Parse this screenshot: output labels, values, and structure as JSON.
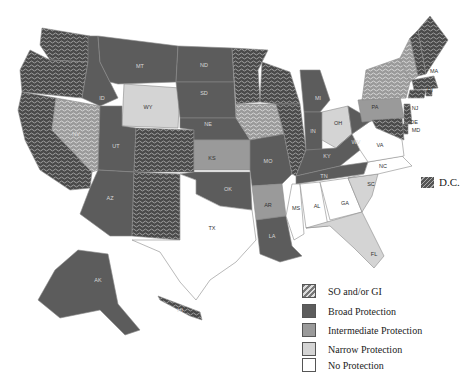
{
  "colors": {
    "so_gi": "#5a5a5a",
    "broad": "#5c5c5c",
    "intermediate": "#9a9a9a",
    "narrow": "#d4d4d4",
    "none": "#ffffff"
  },
  "legend": [
    {
      "key": "so_gi",
      "label": "SO and/or  GI"
    },
    {
      "key": "broad",
      "label": "Broad Protection"
    },
    {
      "key": "intermediate",
      "label": "Intermediate Protection"
    },
    {
      "key": "narrow",
      "label": "Narrow Protection"
    },
    {
      "key": "none",
      "label": "No Protection"
    }
  ],
  "dc": {
    "label": "D.C.",
    "category": "so_gi"
  },
  "states": [
    {
      "abbr": "WA",
      "category": "so_gi"
    },
    {
      "abbr": "OR",
      "category": "so_gi"
    },
    {
      "abbr": "CA",
      "category": "so_gi"
    },
    {
      "abbr": "NV",
      "category": "so_gi"
    },
    {
      "abbr": "ID",
      "category": "broad"
    },
    {
      "abbr": "MT",
      "category": "broad"
    },
    {
      "abbr": "WY",
      "category": "narrow"
    },
    {
      "abbr": "UT",
      "category": "broad"
    },
    {
      "abbr": "AZ",
      "category": "broad"
    },
    {
      "abbr": "CO",
      "category": "so_gi"
    },
    {
      "abbr": "NM",
      "category": "so_gi"
    },
    {
      "abbr": "ND",
      "category": "broad"
    },
    {
      "abbr": "SD",
      "category": "broad"
    },
    {
      "abbr": "NE",
      "category": "broad"
    },
    {
      "abbr": "KS",
      "category": "intermediate"
    },
    {
      "abbr": "OK",
      "category": "broad"
    },
    {
      "abbr": "TX",
      "category": "none"
    },
    {
      "abbr": "MN",
      "category": "so_gi"
    },
    {
      "abbr": "IA",
      "category": "so_gi"
    },
    {
      "abbr": "MO",
      "category": "broad"
    },
    {
      "abbr": "AR",
      "category": "intermediate"
    },
    {
      "abbr": "LA",
      "category": "broad"
    },
    {
      "abbr": "WI",
      "category": "so_gi"
    },
    {
      "abbr": "IL",
      "category": "so_gi"
    },
    {
      "abbr": "MI",
      "category": "broad"
    },
    {
      "abbr": "IN",
      "category": "broad"
    },
    {
      "abbr": "OH",
      "category": "narrow"
    },
    {
      "abbr": "KY",
      "category": "broad"
    },
    {
      "abbr": "TN",
      "category": "broad"
    },
    {
      "abbr": "MS",
      "category": "none"
    },
    {
      "abbr": "AL",
      "category": "none"
    },
    {
      "abbr": "GA",
      "category": "none"
    },
    {
      "abbr": "FL",
      "category": "narrow"
    },
    {
      "abbr": "SC",
      "category": "narrow"
    },
    {
      "abbr": "NC",
      "category": "none"
    },
    {
      "abbr": "VA",
      "category": "none"
    },
    {
      "abbr": "WV",
      "category": "broad"
    },
    {
      "abbr": "PA",
      "category": "intermediate"
    },
    {
      "abbr": "NY",
      "category": "so_gi"
    },
    {
      "abbr": "VT",
      "category": "so_gi"
    },
    {
      "abbr": "NH",
      "category": "so_gi"
    },
    {
      "abbr": "ME",
      "category": "so_gi"
    },
    {
      "abbr": "MA",
      "category": "so_gi"
    },
    {
      "abbr": "RI",
      "category": "so_gi"
    },
    {
      "abbr": "CT",
      "category": "so_gi"
    },
    {
      "abbr": "NJ",
      "category": "so_gi"
    },
    {
      "abbr": "DE",
      "category": "so_gi"
    },
    {
      "abbr": "MD",
      "category": "so_gi"
    },
    {
      "abbr": "AK",
      "category": "broad"
    },
    {
      "abbr": "HI",
      "category": "so_gi"
    }
  ],
  "labels": [
    "MT",
    "ND",
    "ID",
    "WY",
    "SD",
    "NE",
    "NV",
    "UT",
    "KS",
    "AZ",
    "OK",
    "TX",
    "MO",
    "AR",
    "LA",
    "MS",
    "AL",
    "GA",
    "FL",
    "SC",
    "NC",
    "VA",
    "WV",
    "KY",
    "TN",
    "IN",
    "OH",
    "MI",
    "PA",
    "NJ",
    "DE",
    "MD",
    "MA",
    "RI",
    "AK",
    "HI"
  ]
}
